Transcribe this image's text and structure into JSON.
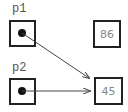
{
  "diagram": {
    "pointers": [
      {
        "name": "p1",
        "points_to": "45"
      },
      {
        "name": "p2",
        "points_to": "45"
      }
    ],
    "values": [
      {
        "value": "86"
      },
      {
        "value": "45"
      }
    ],
    "colors": {
      "border": "#222222",
      "arrow": "#444444",
      "label": "#555555",
      "value_text": "#888888"
    }
  }
}
